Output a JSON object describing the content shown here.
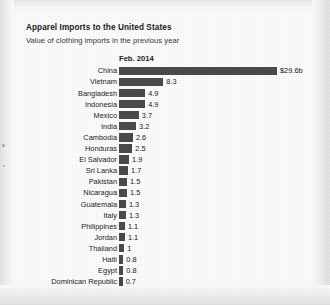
{
  "title": "Apparel Imports to the United States",
  "subtitle": "Value of clothing imports in the previous year",
  "column_header": "Feb. 2014",
  "colors": {
    "bar": "#4b4b4b",
    "text": "#202427",
    "page_background": "#ffffff"
  },
  "chart_data": {
    "type": "bar",
    "orientation": "horizontal",
    "title": "Apparel Imports to the United States",
    "subtitle": "Value of clothing imports in the previous year",
    "column_header": "Feb. 2014",
    "xlabel": "",
    "ylabel": "",
    "unit": "billions of US dollars",
    "grid": false,
    "legend": null,
    "xlim": [
      0,
      29.6
    ],
    "categories": [
      "China",
      "Vietnam",
      "Bangladesh",
      "Indonesia",
      "Mexico",
      "India",
      "Cambodia",
      "Honduras",
      "El Salvador",
      "Sri Lanka",
      "Pakistan",
      "Nicaragua",
      "Guatemala",
      "Italy",
      "Philippines",
      "Jordan",
      "Thailand",
      "Haiti",
      "Egypt",
      "Dominican Republic"
    ],
    "values": [
      29.6,
      8.3,
      4.9,
      4.9,
      3.7,
      3.2,
      2.6,
      2.5,
      1.9,
      1.7,
      1.5,
      1.5,
      1.3,
      1.3,
      1.1,
      1.1,
      1,
      0.8,
      0.8,
      0.7
    ],
    "value_labels": [
      "$29.6b",
      "8.3",
      "4.9",
      "4.9",
      "3.7",
      "3.2",
      "2.6",
      "2.5",
      "1.9",
      "1.7",
      "1.5",
      "1.5",
      "1.3",
      "1.3",
      "1.1",
      "1.1",
      "1",
      "0.8",
      "0.8",
      "0.7"
    ]
  },
  "rows": [
    {
      "label": "China",
      "value": 29.6,
      "value_label": "$29.6b"
    },
    {
      "label": "Vietnam",
      "value": 8.3,
      "value_label": "8.3"
    },
    {
      "label": "Bangladesh",
      "value": 4.9,
      "value_label": "4.9"
    },
    {
      "label": "Indonesia",
      "value": 4.9,
      "value_label": "4.9"
    },
    {
      "label": "Mexico",
      "value": 3.7,
      "value_label": "3.7"
    },
    {
      "label": "India",
      "value": 3.2,
      "value_label": "3.2"
    },
    {
      "label": "Cambodia",
      "value": 2.6,
      "value_label": "2.6"
    },
    {
      "label": "Honduras",
      "value": 2.5,
      "value_label": "2.5"
    },
    {
      "label": "El Salvador",
      "value": 1.9,
      "value_label": "1.9"
    },
    {
      "label": "Sri Lanka",
      "value": 1.7,
      "value_label": "1.7"
    },
    {
      "label": "Pakistan",
      "value": 1.5,
      "value_label": "1.5"
    },
    {
      "label": "Nicaragua",
      "value": 1.5,
      "value_label": "1.5"
    },
    {
      "label": "Guatemala",
      "value": 1.3,
      "value_label": "1.3"
    },
    {
      "label": "Italy",
      "value": 1.3,
      "value_label": "1.3"
    },
    {
      "label": "Philippines",
      "value": 1.1,
      "value_label": "1.1"
    },
    {
      "label": "Jordan",
      "value": 1.1,
      "value_label": "1.1"
    },
    {
      "label": "Thailand",
      "value": 1,
      "value_label": "1"
    },
    {
      "label": "Haiti",
      "value": 0.8,
      "value_label": "0.8"
    },
    {
      "label": "Egypt",
      "value": 0.8,
      "value_label": "0.8"
    },
    {
      "label": "Dominican Republic",
      "value": 0.7,
      "value_label": "0.7"
    }
  ]
}
